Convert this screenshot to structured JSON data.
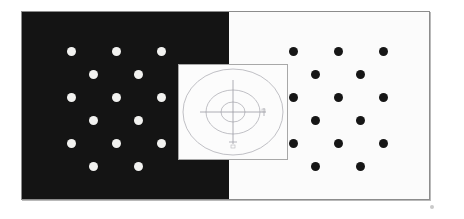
{
  "figure": {
    "title": "Simultaneous contrast dot-grid plate",
    "description": "Scanned plate split into a black left half bearing white dots and a white right half bearing black dots, arranged in identical staggered grids, with a translucent inset square showing concentric ellipses and crosshair axes straddling the boundary.",
    "background_color": "#ffffff",
    "plate_border_color": "#8c8c8c"
  },
  "panels": [
    {
      "id": "dark-panel",
      "name": "left-dark-panel",
      "background_color": "#141414",
      "dot_color": "#f2f2f0",
      "dot_polarity": "white-on-black",
      "dot_count": 16
    },
    {
      "id": "light-panel",
      "name": "right-light-panel",
      "background_color": "#fbfbfb",
      "dot_color": "#161616",
      "dot_polarity": "black-on-white",
      "dot_count": 16
    }
  ],
  "dot_grid": {
    "pattern": "staggered",
    "row_count": 6,
    "dots_per_odd_row": 3,
    "dots_per_even_row": 2,
    "dot_diameter_px": 9,
    "column_spacing_px": 45,
    "row_spacing_px": 23,
    "rows": [
      {
        "index": 1,
        "offset": "aligned",
        "dots": 3
      },
      {
        "index": 2,
        "offset": "staggered",
        "dots": 2
      },
      {
        "index": 3,
        "offset": "aligned",
        "dots": 3
      },
      {
        "index": 4,
        "offset": "staggered",
        "dots": 2
      },
      {
        "index": 5,
        "offset": "aligned",
        "dots": 3
      },
      {
        "index": 6,
        "offset": "staggered",
        "dots": 2
      }
    ]
  },
  "inset": {
    "name": "target-inset",
    "frame_color": "#a8a8a8",
    "background_color": "#fcfcfc",
    "ring_color": "#b0b0b6",
    "axis_color": "#9b9ba2",
    "ring_count": 3,
    "rings": [
      {
        "index": 1,
        "label": "outer-ellipse",
        "rx": 50,
        "ry": 43
      },
      {
        "index": 2,
        "label": "middle-ellipse",
        "rx": 27,
        "ry": 22
      },
      {
        "index": 3,
        "label": "inner-ellipse",
        "rx": 12,
        "ry": 10
      }
    ],
    "crosshair": {
      "horizontal": true,
      "vertical": true
    },
    "tick_marks": [
      {
        "position": "right",
        "label": ""
      },
      {
        "position": "bottom",
        "label": ""
      }
    ]
  },
  "artifacts": {
    "corner_speck": {
      "name": "corner-speck",
      "color": "#c9c9c9"
    }
  }
}
